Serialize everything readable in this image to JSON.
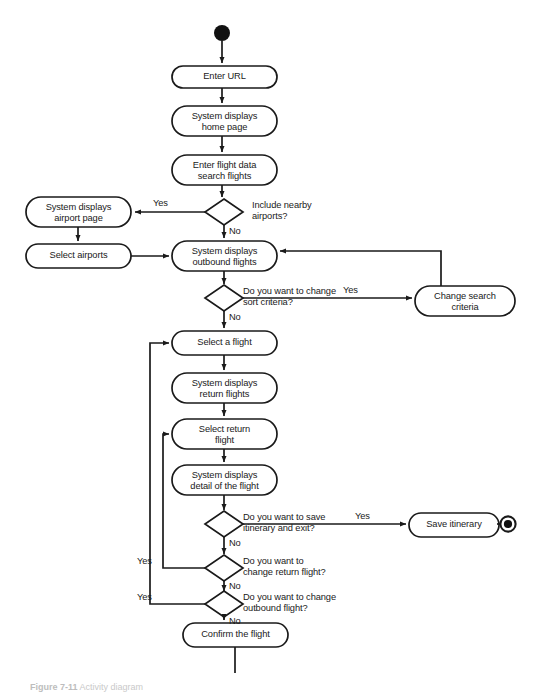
{
  "diagram": {
    "kind": "uml-activity-diagram",
    "colors": {
      "stroke": "#1a1a1a",
      "fill": "#ffffff",
      "text": "#1a1a1a",
      "background": "#ffffff"
    },
    "start_node": {
      "name": "initial-node",
      "cx": 222,
      "cy": 33,
      "r": 8
    },
    "end_node": {
      "name": "final-node",
      "cx": 508,
      "cy": 524,
      "r_outer": 8,
      "r_inner": 4.2
    },
    "activities": [
      {
        "id": "enter-url",
        "label": "Enter URL",
        "x": 172,
        "y": 66,
        "w": 105,
        "h": 22
      },
      {
        "id": "system-home-page",
        "label": "System displays\nhome page",
        "x": 172,
        "y": 106,
        "w": 105,
        "h": 30
      },
      {
        "id": "enter-flight-data",
        "label": "Enter flight data\nsearch flights",
        "x": 172,
        "y": 155,
        "w": 105,
        "h": 30
      },
      {
        "id": "system-airport-page",
        "label": "System displays\nairport page",
        "x": 26,
        "y": 197,
        "w": 105,
        "h": 30
      },
      {
        "id": "select-airports",
        "label": "Select airports",
        "x": 26,
        "y": 244,
        "w": 105,
        "h": 24
      },
      {
        "id": "system-outbound",
        "label": "System displays\noutbound flights",
        "x": 172,
        "y": 241,
        "w": 105,
        "h": 30
      },
      {
        "id": "change-search",
        "label": "Change search\ncriteria",
        "x": 415,
        "y": 286,
        "w": 100,
        "h": 30
      },
      {
        "id": "select-a-flight",
        "label": "Select a flight",
        "x": 172,
        "y": 331,
        "w": 105,
        "h": 24
      },
      {
        "id": "system-return",
        "label": "System displays\nreturn flights",
        "x": 172,
        "y": 373,
        "w": 105,
        "h": 30
      },
      {
        "id": "select-return-flight",
        "label": "Select return\nflight",
        "x": 172,
        "y": 419,
        "w": 105,
        "h": 30
      },
      {
        "id": "system-detail",
        "label": "System displays\ndetail of the flight",
        "x": 172,
        "y": 465,
        "w": 105,
        "h": 30
      },
      {
        "id": "save-itinerary",
        "label": "Save itinerary",
        "x": 409,
        "y": 513,
        "w": 90,
        "h": 24
      },
      {
        "id": "confirm-the-flight",
        "label": "Confirm the flight",
        "x": 183,
        "y": 623,
        "w": 105,
        "h": 24
      }
    ],
    "decisions": [
      {
        "id": "include-nearby",
        "label": "Include nearby\nairports?",
        "cx": 224,
        "cy": 212,
        "rx": 19,
        "ry": 13,
        "label_x": 252,
        "label_y": 200
      },
      {
        "id": "change-sort",
        "label": "Do you want to change\nsort criteria?",
        "cx": 224,
        "cy": 298,
        "rx": 19,
        "ry": 13,
        "label_x": 243,
        "label_y": 286
      },
      {
        "id": "save-and-exit",
        "label": "Do you want to save\nitinerary and exit?",
        "cx": 224,
        "cy": 524,
        "rx": 19,
        "ry": 13,
        "label_x": 243,
        "label_y": 512
      },
      {
        "id": "change-return",
        "label": "Do you want to\nchange return flight?",
        "cx": 224,
        "cy": 568,
        "rx": 19,
        "ry": 13,
        "label_x": 243,
        "label_y": 556
      },
      {
        "id": "change-outbound",
        "label": "Do you want to change\noutbound flight?",
        "cx": 224,
        "cy": 604,
        "rx": 19,
        "ry": 13,
        "label_x": 243,
        "label_y": 592
      }
    ],
    "guards": [
      {
        "id": "guard-nearby-yes",
        "text": "Yes",
        "x": 153,
        "y": 198
      },
      {
        "id": "guard-nearby-no",
        "text": "No",
        "x": 229,
        "y": 226
      },
      {
        "id": "guard-sort-yes",
        "text": "Yes",
        "x": 343,
        "y": 285
      },
      {
        "id": "guard-sort-no",
        "text": "No",
        "x": 229,
        "y": 312
      },
      {
        "id": "guard-save-yes",
        "text": "Yes",
        "x": 355,
        "y": 511
      },
      {
        "id": "guard-save-no",
        "text": "No",
        "x": 229,
        "y": 538
      },
      {
        "id": "guard-return-yes",
        "text": "Yes",
        "x": 137,
        "y": 556
      },
      {
        "id": "guard-return-no",
        "text": "No",
        "x": 229,
        "y": 581
      },
      {
        "id": "guard-outbound-yes",
        "text": "Yes",
        "x": 137,
        "y": 592
      },
      {
        "id": "guard-outbound-no",
        "text": "No",
        "x": 229,
        "y": 616
      }
    ],
    "caption": {
      "prefix": "Figure 7-11",
      "text": "Activity diagram"
    }
  }
}
